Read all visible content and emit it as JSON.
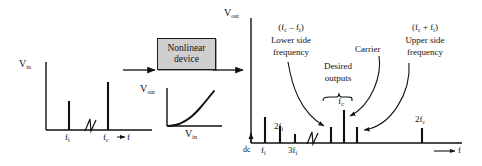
{
  "figure": {
    "block": {
      "line1": "Nonlinear",
      "line2": "device",
      "fill_color": "#cfcfcf",
      "border_color": "#1a1a1a"
    },
    "input_plot": {
      "y_axis_label": "V",
      "y_axis_sub": "in",
      "x_axis_label": "f",
      "ticks": [
        {
          "label": "f",
          "sub": "i"
        },
        {
          "label": "f",
          "sub": "c"
        }
      ],
      "spikes": [
        {
          "name": "f_i",
          "x_frac": 0.22,
          "height_frac": 0.42
        },
        {
          "name": "f_c",
          "x_frac": 0.7,
          "height_frac": 0.95
        }
      ],
      "break_symbol": true
    },
    "transfer_plot": {
      "y_axis_label": "V",
      "y_axis_sub": "out",
      "x_axis_label": "V",
      "x_axis_sub": "in",
      "curve_shape": "exponential-rising"
    },
    "output_plot": {
      "y_axis_label": "V",
      "y_axis_sub": "out",
      "x_axis_label": "f",
      "origin_label": "dc",
      "break_symbol": true,
      "ticks": [
        {
          "label": "f",
          "sub": "i",
          "prefix": ""
        },
        {
          "label": "f",
          "sub": "i",
          "prefix": "2"
        },
        {
          "label": "f",
          "sub": "i",
          "prefix": "3"
        },
        {
          "label": "f",
          "sub": "c",
          "prefix": "2"
        }
      ],
      "annotations": {
        "lower_side": {
          "formula": "(f – f )",
          "formula_parts": {
            "open": "(f",
            "sub1": "c",
            "op": " – f",
            "sub2": "i",
            "close": ")"
          },
          "line1": "Lower side",
          "line2": "frequency"
        },
        "upper_side": {
          "formula_parts": {
            "open": "(f",
            "sub1": "c",
            "op": " + f",
            "sub2": "i",
            "close": ")"
          },
          "line1": "Upper side",
          "line2": "frequency"
        },
        "carrier": "Carrier",
        "desired": {
          "line1": "Desired",
          "line2": "outputs",
          "brace_label": "f",
          "brace_label_sub": "c"
        }
      },
      "spikes": [
        {
          "name": "f_i",
          "height_frac": 0.62
        },
        {
          "name": "2f_i",
          "height_frac": 0.42
        },
        {
          "name": "3f_i",
          "height_frac": 0.22
        },
        {
          "name": "f_c - f_i",
          "height_frac": 0.32
        },
        {
          "name": "f_c",
          "height_frac": 0.8
        },
        {
          "name": "f_c + f_i",
          "height_frac": 0.32
        },
        {
          "name": "2f_c",
          "height_frac": 0.3
        }
      ]
    },
    "flow_arrows": 2,
    "stroke_color": "#111111"
  }
}
